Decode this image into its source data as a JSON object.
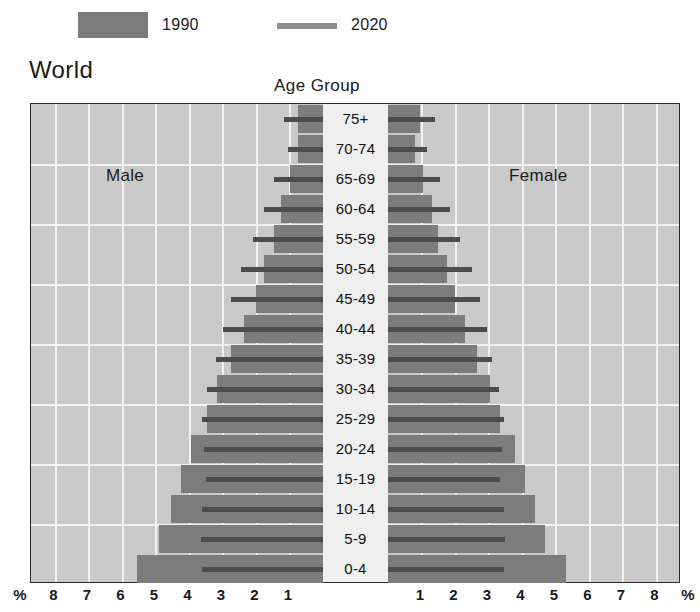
{
  "legend": {
    "items": [
      {
        "label": "1990",
        "type": "swatch",
        "color": "#7c7c7c"
      },
      {
        "label": "2020",
        "type": "line",
        "color": "#8e8e8e"
      }
    ]
  },
  "titles": {
    "chart_title": "World",
    "age_group": "Age Group",
    "male": "Male",
    "female": "Female"
  },
  "axis": {
    "left_ticks": [
      "%",
      "8",
      "7",
      "6",
      "5",
      "4",
      "3",
      "2",
      "1"
    ],
    "right_ticks": [
      "1",
      "2",
      "3",
      "4",
      "5",
      "6",
      "7",
      "8",
      "%"
    ],
    "unit": "%"
  },
  "chart_data": {
    "type": "bar",
    "subtype": "population-pyramid",
    "title": "World",
    "xlabel": "%",
    "ylabel": "Age Group",
    "xlim": [
      0,
      8.5
    ],
    "grid": true,
    "legend_position": "top",
    "categories": [
      "75+",
      "70-74",
      "65-69",
      "60-64",
      "55-59",
      "50-54",
      "45-49",
      "40-44",
      "35-39",
      "30-34",
      "25-29",
      "20-24",
      "15-19",
      "10-14",
      "5-9",
      "0-4"
    ],
    "series": [
      {
        "name": "1990",
        "color": "#7c7c7c",
        "male": [
          0.75,
          0.75,
          1.0,
          1.25,
          1.45,
          1.75,
          2.0,
          2.35,
          2.75,
          3.15,
          3.45,
          3.95,
          4.25,
          4.55,
          4.9,
          5.55
        ],
        "female": [
          0.95,
          0.8,
          1.05,
          1.3,
          1.5,
          1.75,
          2.0,
          2.3,
          2.65,
          3.05,
          3.35,
          3.8,
          4.1,
          4.4,
          4.7,
          5.3
        ]
      },
      {
        "name": "2020",
        "color": "#4c4c4c",
        "male": [
          1.15,
          1.05,
          1.45,
          1.75,
          2.1,
          2.45,
          2.75,
          3.0,
          3.2,
          3.45,
          3.6,
          3.55,
          3.5,
          3.6,
          3.65,
          3.6
        ],
        "female": [
          1.4,
          1.15,
          1.55,
          1.85,
          2.15,
          2.5,
          2.75,
          2.95,
          3.1,
          3.3,
          3.45,
          3.4,
          3.35,
          3.45,
          3.5,
          3.45
        ]
      }
    ]
  }
}
